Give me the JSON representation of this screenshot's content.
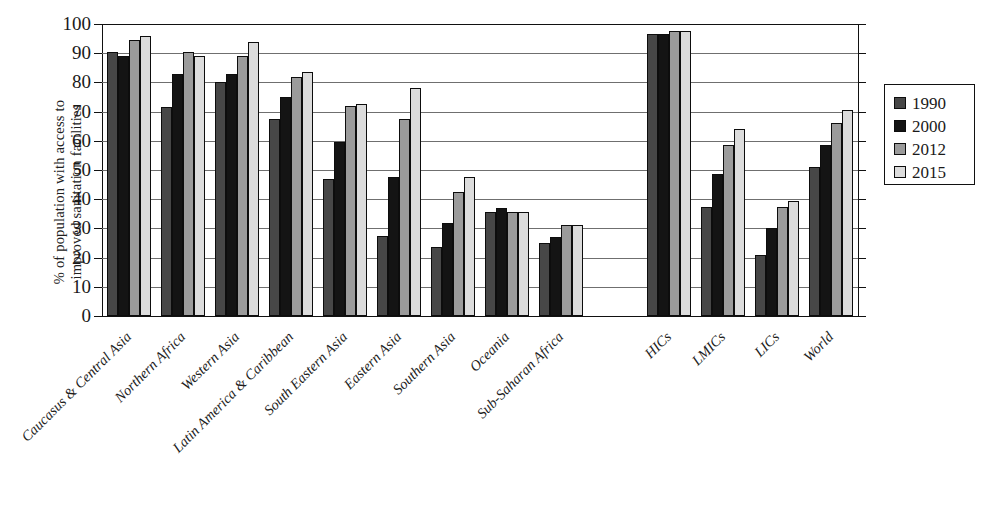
{
  "chart_data": {
    "type": "bar",
    "title": "",
    "subtitle": "",
    "xlabel": "",
    "ylabel_line1": "% of population with access to",
    "ylabel_line2": "improved sanitation facilities",
    "ylim": [
      0,
      100
    ],
    "ytick_labels": [
      "0",
      "10",
      "20",
      "30",
      "40",
      "50",
      "60",
      "70",
      "80",
      "90",
      "100"
    ],
    "ytick_values": [
      0,
      10,
      20,
      30,
      40,
      50,
      60,
      70,
      80,
      90,
      100
    ],
    "grid": true,
    "grid_axis": "y",
    "legend_position": "right-outside",
    "categories": [
      "Caucasus & Central Asia",
      "Northern Africa",
      "Western Asia",
      "Latin America & Caribbean",
      "South Eastern Asia",
      "Eastern Asia",
      "Southern Asia",
      "Oceania",
      "Sub-Saharan Africa",
      "HICs",
      "LMICs",
      "LICs",
      "World"
    ],
    "series": [
      {
        "name": "1990",
        "color": "#474747",
        "values": [
          90.5,
          71.5,
          80.0,
          67.5,
          47.0,
          27.5,
          23.5,
          35.5,
          25.0,
          96.5,
          37.5,
          21.0,
          51.0
        ]
      },
      {
        "name": "2000",
        "color": "#141414",
        "values": [
          89.0,
          83.0,
          83.0,
          75.0,
          59.5,
          47.5,
          32.0,
          37.0,
          27.0,
          96.5,
          48.5,
          30.0,
          58.5
        ]
      },
      {
        "name": "2012",
        "color": "#9b9b9b",
        "values": [
          94.5,
          90.5,
          89.0,
          82.0,
          72.0,
          67.5,
          42.5,
          35.5,
          31.0,
          97.5,
          58.5,
          37.5,
          66.0
        ]
      },
      {
        "name": "2015",
        "color": "#dcdcdc",
        "values": [
          96.0,
          89.0,
          94.0,
          83.5,
          72.5,
          78.0,
          47.5,
          35.5,
          31.0,
          97.5,
          64.0,
          39.5,
          70.5
        ]
      }
    ]
  },
  "legend": {
    "items": [
      {
        "label": "1990"
      },
      {
        "label": "2000"
      },
      {
        "label": "2012"
      },
      {
        "label": "2015"
      }
    ]
  }
}
